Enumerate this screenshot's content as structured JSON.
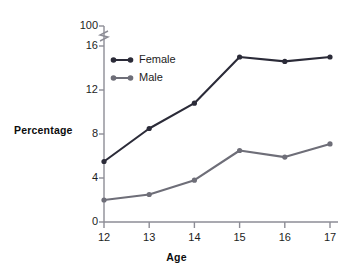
{
  "chart_data": {
    "type": "line",
    "title": "",
    "subtitle": "",
    "xlabel": "Age",
    "ylabel": "Percentage",
    "categories": [
      "12",
      "13",
      "14",
      "15",
      "16",
      "17"
    ],
    "x": [
      12,
      13,
      14,
      15,
      16,
      17
    ],
    "xlim": [
      12,
      17
    ],
    "ylim": [
      0,
      16
    ],
    "y_axis_break": {
      "present": true,
      "break_between": [
        16,
        100
      ],
      "top_label": "100",
      "symbol": "zigzag"
    },
    "yticks": [
      0,
      4,
      8,
      12,
      16,
      100
    ],
    "ytick_labels": [
      "0",
      "4",
      "8",
      "12",
      "16",
      "100"
    ],
    "xticks": [
      12,
      13,
      14,
      15,
      16,
      17
    ],
    "xtick_labels": [
      "12",
      "13",
      "14",
      "15",
      "16",
      "17"
    ],
    "grid": false,
    "legend_position": "upper-left-inside",
    "series": [
      {
        "name": "Female",
        "color": "#2b2b38",
        "values": [
          5.5,
          8.5,
          10.8,
          15.0,
          14.6,
          15.0
        ]
      },
      {
        "name": "Male",
        "color": "#6e6e78",
        "values": [
          2.0,
          2.5,
          3.8,
          6.5,
          5.9,
          7.1
        ]
      }
    ],
    "annotations": []
  },
  "legend": {
    "items": [
      {
        "label": "Female",
        "color": "#2b2b38"
      },
      {
        "label": "Male",
        "color": "#6e6e78"
      }
    ]
  },
  "axes": {
    "y_title": "Percentage",
    "x_title": "Age",
    "axis_color": "#8d8d96"
  }
}
